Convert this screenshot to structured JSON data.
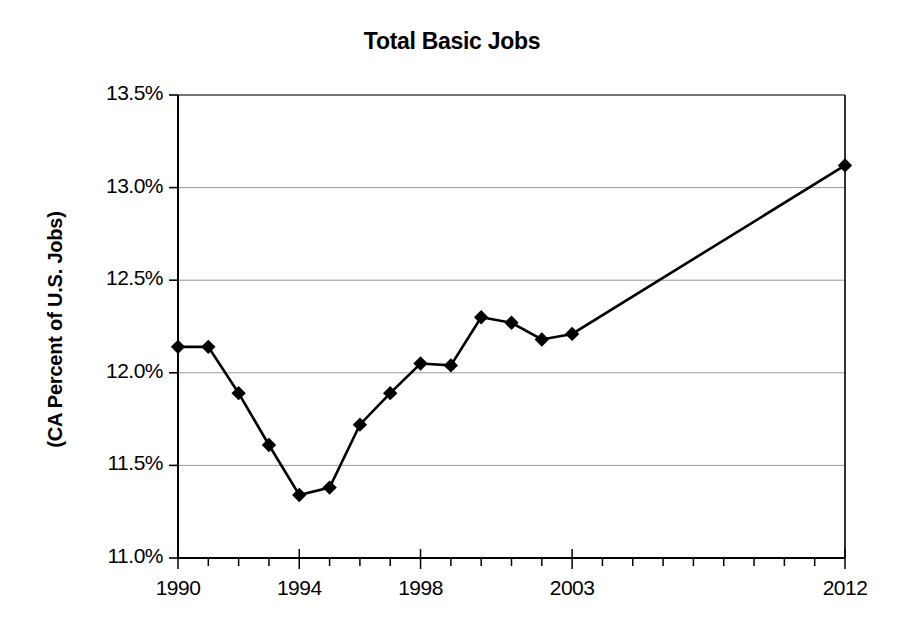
{
  "chart_data": {
    "type": "line",
    "title": "Total Basic Jobs",
    "xlabel": "",
    "ylabel": "(CA Percent of U.S. Jobs)",
    "ylim": [
      11.0,
      13.5
    ],
    "xlim": [
      1990,
      2012
    ],
    "grid": true,
    "legend": "none",
    "marker": "diamond",
    "y_tick_labels": [
      "13.5%",
      "13.0%",
      "12.5%",
      "12.0%",
      "11.5%",
      "11.0%"
    ],
    "y_tick_values": [
      13.5,
      13.0,
      12.5,
      12.0,
      11.5,
      11.0
    ],
    "x_tick_labels": [
      "1990",
      "1994",
      "1998",
      "2003",
      "2012"
    ],
    "x_tick_values": [
      1990,
      1994,
      1998,
      2003,
      2012
    ],
    "x_minor_ticks": [
      1990,
      1991,
      1992,
      1993,
      1994,
      1995,
      1996,
      1997,
      1998,
      1999,
      2000,
      2001,
      2002,
      2003,
      2004,
      2005,
      2006,
      2007,
      2008,
      2009,
      2010,
      2011,
      2012
    ],
    "x": [
      1990,
      1991,
      1992,
      1993,
      1994,
      1995,
      1996,
      1997,
      1998,
      1999,
      2000,
      2001,
      2002,
      2003,
      2012
    ],
    "values": [
      12.14,
      12.14,
      11.89,
      11.61,
      11.34,
      11.38,
      11.72,
      11.89,
      12.05,
      12.04,
      12.3,
      12.27,
      12.18,
      12.21,
      13.12
    ],
    "series": [
      {
        "name": "CA Percent of U.S. Jobs",
        "values": [
          12.14,
          12.14,
          11.89,
          11.61,
          11.34,
          11.38,
          11.72,
          11.89,
          12.05,
          12.04,
          12.3,
          12.27,
          12.18,
          12.21,
          13.12
        ]
      }
    ]
  }
}
